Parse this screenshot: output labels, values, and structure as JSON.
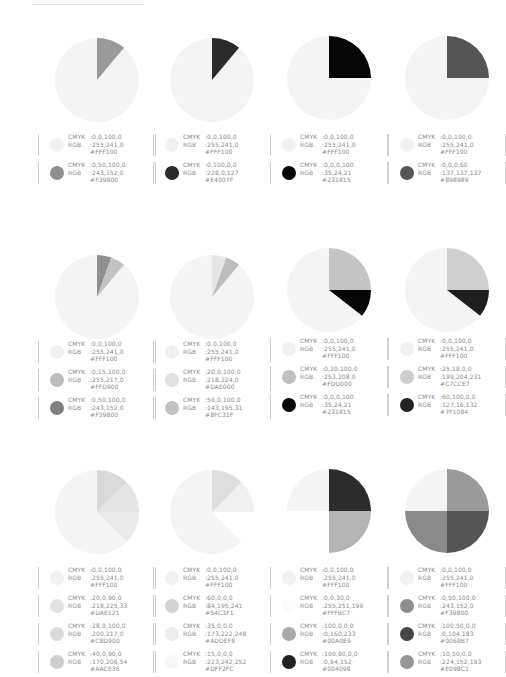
{
  "chart_data": [
    {
      "type": "pie",
      "title": "",
      "slices": [
        {
          "name": "Yellow",
          "cmyk": "0,0,100,0",
          "rgb": "255,241,0",
          "hex": "#FFF100",
          "value": 87.5
        },
        {
          "name": "Orange",
          "cmyk": "0,50,100,0",
          "rgb": "243,152,0",
          "hex": "#F39800",
          "value": 12.5
        }
      ]
    },
    {
      "type": "pie",
      "title": "",
      "slices": [
        {
          "name": "Yellow",
          "cmyk": "0,0,100,0",
          "rgb": "255,241,0",
          "hex": "#FFF100",
          "value": 87.5
        },
        {
          "name": "Magenta",
          "cmyk": "0,100,0,0",
          "rgb": "228,0,127",
          "hex": "#E4007F",
          "value": 12.5
        }
      ]
    },
    {
      "type": "pie",
      "title": "",
      "slices": [
        {
          "name": "Yellow",
          "cmyk": "0,0,100,0",
          "rgb": "255,241,0",
          "hex": "#FFF100",
          "value": 75
        },
        {
          "name": "Black",
          "cmyk": "0,0,0,100",
          "rgb": "35,24,21",
          "hex": "#231815",
          "value": 25
        }
      ]
    },
    {
      "type": "pie",
      "title": "",
      "slices": [
        {
          "name": "Yellow",
          "cmyk": "0,0,100,0",
          "rgb": "255,241,0",
          "hex": "#FFF100",
          "value": 75
        },
        {
          "name": "Gray",
          "cmyk": "0,0,0,60",
          "rgb": "137,137,137",
          "hex": "#898989",
          "value": 25
        }
      ]
    },
    {
      "type": "pie",
      "title": "",
      "slices": [
        {
          "name": "Yellow",
          "cmyk": "0,0,100,0",
          "rgb": "255,241,0",
          "hex": "#FFF100",
          "value": 86
        },
        {
          "name": "Orange",
          "cmyk": "0,50,100,0",
          "rgb": "243,152,0",
          "hex": "#F39800",
          "value": 7
        },
        {
          "name": "Gold",
          "cmyk": "0,15,100,0",
          "rgb": "255,217,0",
          "hex": "#FFD900",
          "value": 7
        }
      ]
    },
    {
      "type": "pie",
      "title": "",
      "slices": [
        {
          "name": "Yellow",
          "cmyk": "0,0,100,0",
          "rgb": "255,241,0",
          "hex": "#FFF100",
          "value": 86
        },
        {
          "name": "Lime",
          "cmyk": "20,0,100,0",
          "rgb": "218,224,0",
          "hex": "#DAE000",
          "value": 7
        },
        {
          "name": "Green",
          "cmyk": "50,0,100,0",
          "rgb": "143,195,31",
          "hex": "#8FC31F",
          "value": 7
        }
      ]
    },
    {
      "type": "pie",
      "title": "",
      "slices": [
        {
          "name": "Yellow",
          "cmyk": "0,0,100,0",
          "rgb": "255,241,0",
          "hex": "#FFF100",
          "value": 65
        },
        {
          "name": "Gold",
          "cmyk": "0,20,100,0",
          "rgb": "253,208,0",
          "hex": "#FDD000",
          "value": 25
        },
        {
          "name": "Black",
          "cmyk": "0,0,0,100",
          "rgb": "35,24,21",
          "hex": "#231815",
          "value": 10
        }
      ]
    },
    {
      "type": "pie",
      "title": "",
      "slices": [
        {
          "name": "Yellow",
          "cmyk": "0,0,100,0",
          "rgb": "255,241,0",
          "hex": "#FFF100",
          "value": 65
        },
        {
          "name": "Lavender",
          "cmyk": "25,18,0,0",
          "rgb": "199,204,231",
          "hex": "#C7CCE7",
          "value": 25
        },
        {
          "name": "Purple",
          "cmyk": "60,100,0,0",
          "rgb": "127,16,132",
          "hex": "#7F1084",
          "value": 10
        }
      ]
    },
    {
      "type": "pie",
      "title": "",
      "slices": [
        {
          "name": "Yellow",
          "cmyk": "0,0,100,0",
          "rgb": "255,241,0",
          "hex": "#FFF100",
          "value": 62.5
        },
        {
          "name": "Yellow-green",
          "cmyk": "20,0,90,0",
          "rgb": "218,225,33",
          "hex": "#DAE121",
          "value": 12.5
        },
        {
          "name": "Lime",
          "cmyk": "28,0,100,0",
          "rgb": "200,217,0",
          "hex": "#C8D900",
          "value": 12.5
        },
        {
          "name": "Green",
          "cmyk": "40,0,90,0",
          "rgb": "170,206,54",
          "hex": "#AACE36",
          "value": 12.5
        }
      ]
    },
    {
      "type": "pie",
      "title": "",
      "slices": [
        {
          "name": "Yellow",
          "cmyk": "0,0,100,0",
          "rgb": "255,241,0",
          "hex": "#FFF100",
          "value": 62.5
        },
        {
          "name": "Sky blue",
          "cmyk": "60,0,0,0",
          "rgb": "84,195,241",
          "hex": "#54C3F1",
          "value": 12.5
        },
        {
          "name": "Light blue",
          "cmyk": "35,0,0,0",
          "rgb": "173,222,248",
          "hex": "#ADDEF8",
          "value": 12.5
        },
        {
          "name": "Pale blue",
          "cmyk": "15,0,0,0",
          "rgb": "223,242,252",
          "hex": "#DFF2FC",
          "value": 12.5
        }
      ]
    },
    {
      "type": "pie",
      "title": "",
      "slices": [
        {
          "name": "Yellow",
          "cmyk": "0,0,100,0",
          "rgb": "255,241,0",
          "hex": "#FFF100",
          "value": 25
        },
        {
          "name": "Cream",
          "cmyk": "0,0,30,0",
          "rgb": "255,251,199",
          "hex": "#FFFBC7",
          "value": 25
        },
        {
          "name": "Cyan",
          "cmyk": "100,0,0,0",
          "rgb": "0,160,233",
          "hex": "#00A0E9",
          "value": 25
        },
        {
          "name": "Navy",
          "cmyk": "100,80,0,0",
          "rgb": "0,64,152",
          "hex": "#004098",
          "value": 25
        }
      ]
    },
    {
      "type": "pie",
      "title": "",
      "slices": [
        {
          "name": "Yellow",
          "cmyk": "0,0,100,0",
          "rgb": "255,241,0",
          "hex": "#FFF100",
          "value": 25
        },
        {
          "name": "Orange",
          "cmyk": "0,50,100,0",
          "rgb": "243,152,0",
          "hex": "#F39800",
          "value": 25
        },
        {
          "name": "Blue",
          "cmyk": "100,50,0,0",
          "rgb": "0,104,183",
          "hex": "#0068B7",
          "value": 25
        },
        {
          "name": "Pink",
          "cmyk": "10,50,0,0",
          "rgb": "224,152,193",
          "hex": "#E098C1",
          "value": 25
        }
      ]
    }
  ],
  "labels": {
    "cmyk": "CMYK",
    "rgb": "RGB"
  },
  "cards": [
    {
      "x": 38,
      "cy": 80,
      "legend_top": 133,
      "pie": [
        {
          "color": "#f4f4f4",
          "start": 40,
          "end": 360
        },
        {
          "color": "#9a9a9a",
          "start": 0,
          "end": 40
        }
      ],
      "legend": [
        {
          "dot": "#f1f1f1",
          "cmyk": ":0,0,100,0",
          "rgb": ":255,241,0",
          "hex": "#FFF100"
        },
        {
          "dot": "#8e8e8e",
          "cmyk": ":0,50,100,0",
          "rgb": ":243,152,0",
          "hex": "#F39800"
        }
      ]
    },
    {
      "x": 153,
      "cy": 80,
      "legend_top": 133,
      "pie": [
        {
          "color": "#f4f4f4",
          "start": 40,
          "end": 360
        },
        {
          "color": "#2b2b2b",
          "start": 0,
          "end": 40
        }
      ],
      "legend": [
        {
          "dot": "#f1f1f1",
          "cmyk": ":0,0,100,0",
          "rgb": ":255,241,0",
          "hex": "#FFF100"
        },
        {
          "dot": "#2a2a2a",
          "cmyk": ":0,100,0,0",
          "rgb": ":228,0,127",
          "hex": "#E4007F"
        }
      ]
    },
    {
      "x": 270,
      "cy": 78,
      "legend_top": 133,
      "pie": [
        {
          "color": "#f4f4f4",
          "start": 90,
          "end": 360
        },
        {
          "color": "#050505",
          "start": 0,
          "end": 90
        }
      ],
      "legend": [
        {
          "dot": "#f1f1f1",
          "cmyk": ":0,0,100,0",
          "rgb": ":255,241,0",
          "hex": "#FFF100"
        },
        {
          "dot": "#060606",
          "cmyk": ":0,0,0,100",
          "rgb": ":35,24,21",
          "hex": "#231815"
        }
      ]
    },
    {
      "x": 388,
      "cy": 78,
      "legend_top": 133,
      "pie": [
        {
          "color": "#f4f4f4",
          "start": 90,
          "end": 360
        },
        {
          "color": "#555555",
          "start": 0,
          "end": 90
        }
      ],
      "legend": [
        {
          "dot": "#f1f1f1",
          "cmyk": ":0,0,100,0",
          "rgb": ":255,241,0",
          "hex": "#FFF100"
        },
        {
          "dot": "#555555",
          "cmyk": ":0,0,0,60",
          "rgb": ":137,137,137",
          "hex": "#898989"
        }
      ]
    },
    {
      "x": 38,
      "cy": 297,
      "legend_top": 340,
      "pie": [
        {
          "color": "#f4f4f4",
          "start": 40,
          "end": 360
        },
        {
          "color": "#8f8f8f",
          "start": 0,
          "end": 20
        },
        {
          "color": "#c2c2c2",
          "start": 20,
          "end": 40
        }
      ],
      "legend": [
        {
          "dot": "#f1f1f1",
          "cmyk": ":0,0,100,0",
          "rgb": ":255,241,0",
          "hex": "#FFF100"
        },
        {
          "dot": "#bdbdbd",
          "cmyk": ":0,15,100,0",
          "rgb": ":255,217,0",
          "hex": "#FFD900"
        },
        {
          "dot": "#7f7f7f",
          "cmyk": ":0,50,100,0",
          "rgb": ":243,152,0",
          "hex": "#F39800"
        }
      ]
    },
    {
      "x": 153,
      "cy": 297,
      "legend_top": 340,
      "pie": [
        {
          "color": "#f4f4f4",
          "start": 40,
          "end": 360
        },
        {
          "color": "#e6e6e6",
          "start": 0,
          "end": 20
        },
        {
          "color": "#bdbdbd",
          "start": 20,
          "end": 40
        }
      ],
      "legend": [
        {
          "dot": "#f1f1f1",
          "cmyk": ":0,0,100,0",
          "rgb": ":255,241,0",
          "hex": "#FFF100"
        },
        {
          "dot": "#e2e2e2",
          "cmyk": ":20,0,100,0",
          "rgb": ":218,224,0",
          "hex": "#DAE000"
        },
        {
          "dot": "#c2c2c2",
          "cmyk": ":50,0,100,0",
          "rgb": ":143,195,31",
          "hex": "#8FC31F"
        }
      ]
    },
    {
      "x": 270,
      "cy": 290,
      "legend_top": 337,
      "pie": [
        {
          "color": "#f4f4f4",
          "start": 128,
          "end": 360
        },
        {
          "color": "#c4c4c4",
          "start": 0,
          "end": 90
        },
        {
          "color": "#050505",
          "start": 90,
          "end": 128
        }
      ],
      "legend": [
        {
          "dot": "#f1f1f1",
          "cmyk": ":0,0,100,0",
          "rgb": ":255,241,0",
          "hex": "#FFF100"
        },
        {
          "dot": "#c0c0c0",
          "cmyk": ":0,20,100,0",
          "rgb": ":253,208,0",
          "hex": "#FDD000"
        },
        {
          "dot": "#060606",
          "cmyk": ":0,0,0,100",
          "rgb": ":35,24,21",
          "hex": "#231815"
        }
      ]
    },
    {
      "x": 388,
      "cy": 290,
      "legend_top": 337,
      "pie": [
        {
          "color": "#f4f4f4",
          "start": 128,
          "end": 360
        },
        {
          "color": "#cfcfcf",
          "start": 0,
          "end": 90
        },
        {
          "color": "#1e1e1e",
          "start": 90,
          "end": 128
        }
      ],
      "legend": [
        {
          "dot": "#f1f1f1",
          "cmyk": ":0,0,100,0",
          "rgb": ":255,241,0",
          "hex": "#FFF100"
        },
        {
          "dot": "#cccccc",
          "cmyk": ":25,18,0,0",
          "rgb": ":199,204,231",
          "hex": "#C7CCE7"
        },
        {
          "dot": "#232323",
          "cmyk": ":60,100,0,0",
          "rgb": ":127,16,132",
          "hex": "#7F1084"
        }
      ]
    },
    {
      "x": 38,
      "cy": 512,
      "legend_top": 566,
      "pie": [
        {
          "color": "#f4f4f4",
          "start": 135,
          "end": 360
        },
        {
          "color": "#dadada",
          "start": 0,
          "end": 45
        },
        {
          "color": "#e4e4e4",
          "start": 45,
          "end": 90
        },
        {
          "color": "#e9e9e9",
          "start": 90,
          "end": 135
        }
      ],
      "legend": [
        {
          "dot": "#f1f1f1",
          "cmyk": ":0,0,100,0",
          "rgb": ":255,241,0",
          "hex": "#FFF100"
        },
        {
          "dot": "#e2e2e2",
          "cmyk": ":20,0,90,0",
          "rgb": ":218,225,33",
          "hex": "#DAE121"
        },
        {
          "dot": "#dadada",
          "cmyk": ":28,0,100,0",
          "rgb": ":200,217,0",
          "hex": "#C8D900"
        },
        {
          "dot": "#cdcdcd",
          "cmyk": ":40,0,90,0",
          "rgb": ":170,206,54",
          "hex": "#AACE36"
        }
      ]
    },
    {
      "x": 153,
      "cy": 512,
      "legend_top": 566,
      "pie": [
        {
          "color": "#f4f4f4",
          "start": 135,
          "end": 360
        },
        {
          "color": "#dedede",
          "start": 0,
          "end": 45
        },
        {
          "color": "#f0f0f0",
          "start": 45,
          "end": 90
        },
        {
          "color": "#ffffff",
          "start": 90,
          "end": 135
        }
      ],
      "legend": [
        {
          "dot": "#f1f1f1",
          "cmyk": ":0,0,100,0",
          "rgb": ":255,241,0",
          "hex": "#FFF100"
        },
        {
          "dot": "#d2d2d2",
          "cmyk": ":60,0,0,0",
          "rgb": ":84,195,241",
          "hex": "#54C3F1"
        },
        {
          "dot": "#ededed",
          "cmyk": ":35,0,0,0",
          "rgb": ":173,222,248",
          "hex": "#ADDEF8"
        },
        {
          "dot": "#f7f7f7",
          "cmyk": ":15,0,0,0",
          "rgb": ":223,242,252",
          "hex": "#DFF2FC"
        }
      ]
    },
    {
      "x": 270,
      "cy": 511,
      "legend_top": 566,
      "pie": [
        {
          "color": "#f4f4f4",
          "start": 270,
          "end": 360
        },
        {
          "color": "#2c2c2c",
          "start": 0,
          "end": 90
        },
        {
          "color": "#b4b4b4",
          "start": 90,
          "end": 180
        },
        {
          "color": "#ffffff",
          "start": 180,
          "end": 270
        }
      ],
      "legend": [
        {
          "dot": "#f1f1f1",
          "cmyk": ":0,0,100,0",
          "rgb": ":255,241,0",
          "hex": "#FFF100"
        },
        {
          "dot": "#fbfbfb",
          "cmyk": ":0,0,30,0",
          "rgb": ":255,251,199",
          "hex": "#FFFBC7"
        },
        {
          "dot": "#aaaaaa",
          "cmyk": ":100,0,0,0",
          "rgb": ":0,160,233",
          "hex": "#00A0E9"
        },
        {
          "dot": "#222222",
          "cmyk": ":100,80,0,0",
          "rgb": ":0,64,152",
          "hex": "#004098"
        }
      ]
    },
    {
      "x": 388,
      "cy": 511,
      "legend_top": 566,
      "pie": [
        {
          "color": "#f4f4f4",
          "start": 270,
          "end": 360
        },
        {
          "color": "#9a9a9a",
          "start": 0,
          "end": 90
        },
        {
          "color": "#545454",
          "start": 90,
          "end": 180
        },
        {
          "color": "#8a8a8a",
          "start": 180,
          "end": 270
        }
      ],
      "legend": [
        {
          "dot": "#f1f1f1",
          "cmyk": ":0,0,100,0",
          "rgb": ":255,241,0",
          "hex": "#FFF100"
        },
        {
          "dot": "#8e8e8e",
          "cmyk": ":0,50,100,0",
          "rgb": ":243,152,0",
          "hex": "#F39800"
        },
        {
          "dot": "#464646",
          "cmyk": ":100,50,0,0",
          "rgb": ":0,104,183",
          "hex": "#0068B7"
        },
        {
          "dot": "#959595",
          "cmyk": ":10,50,0,0",
          "rgb": ":224,152,193",
          "hex": "#E098C1"
        }
      ]
    }
  ]
}
